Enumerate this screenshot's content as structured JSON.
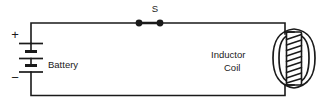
{
  "figure": {
    "type": "electrical-circuit-schematic",
    "title": "",
    "background_color": "#ffffff",
    "line_color": "#1a1a1a",
    "width": 317,
    "height": 107
  },
  "labels": {
    "switch": "S",
    "battery": "Battery",
    "inductor_line1": "Inductor",
    "inductor_line2": "Coil",
    "positive_terminal": "+",
    "negative_terminal": "−"
  },
  "components": {
    "battery": {
      "name": "Battery",
      "symbol": "multi-cell-battery",
      "cells": 2,
      "plates": 5,
      "positive_side": "top",
      "negative_side": "bottom"
    },
    "switch": {
      "name": "S",
      "symbol": "closed-switch",
      "state": "closed",
      "terminals": 2
    },
    "inductor": {
      "name": "Inductor Coil",
      "symbol": "solenoid-with-magnetic-field",
      "turns": 9,
      "field_lines": 4,
      "orientation": "vertical"
    }
  },
  "wires": {
    "top_rail": "battery-positive to switch to inductor-top",
    "bottom_rail": "inductor-bottom to battery-negative",
    "left_rail": "battery vertical branch"
  }
}
